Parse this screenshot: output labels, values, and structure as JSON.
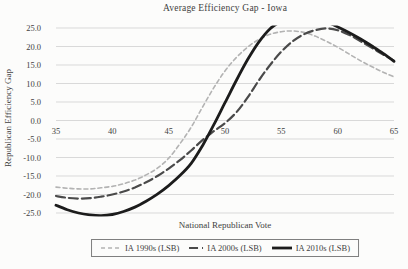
{
  "chart_data": {
    "type": "line",
    "title": "Average Efficiency Gap - Iowa",
    "xlabel": "National Republican Vote",
    "ylabel": "Republican Efficiency Gap",
    "xlim": [
      35,
      65
    ],
    "ylim": [
      -25,
      25
    ],
    "x_ticks": [
      "35",
      "40",
      "45",
      "50",
      "55",
      "60",
      "65"
    ],
    "y_ticks": [
      {
        "value": 25,
        "label": "25.0"
      },
      {
        "value": 20,
        "label": "20.0"
      },
      {
        "value": 15,
        "label": "15.0"
      },
      {
        "value": 10,
        "label": "10.0"
      },
      {
        "value": 5,
        "label": "5.0"
      },
      {
        "value": 0,
        "label": "0.0"
      },
      {
        "value": -5,
        "label": "-5.0"
      },
      {
        "value": -10,
        "label": "-10.0"
      },
      {
        "value": -15,
        "label": "-15.0"
      },
      {
        "value": -20,
        "label": "-20.0"
      },
      {
        "value": -25,
        "label": "-25.0"
      }
    ],
    "grid": "horizontal",
    "gridline_color": "#d9d9d9",
    "legend_position": "bottom",
    "x": [
      35,
      36,
      37,
      38,
      39,
      40,
      41,
      42,
      43,
      44,
      45,
      46,
      47,
      48,
      49,
      50,
      51,
      52,
      53,
      54,
      55,
      56,
      57,
      58,
      59,
      60,
      61,
      62,
      63,
      64,
      65
    ],
    "series": [
      {
        "name": "IA 1990s (LSB)",
        "color": "#b3b3b3",
        "dash": "4 3",
        "width": 1.6,
        "values": [
          -18.0,
          -18.3,
          -18.5,
          -18.5,
          -18.2,
          -17.8,
          -17.1,
          -16.1,
          -14.7,
          -12.9,
          -10.2,
          -6.3,
          -1.8,
          3.6,
          8.8,
          13.4,
          17.0,
          19.8,
          21.9,
          23.3,
          24.0,
          24.2,
          23.8,
          22.8,
          21.4,
          19.8,
          18.0,
          16.2,
          14.6,
          13.1,
          11.8
        ]
      },
      {
        "name": "IA 2000s (LSB)",
        "color": "#4a4a4a",
        "dash": "9 4",
        "width": 2.2,
        "values": [
          -20.4,
          -20.9,
          -21.1,
          -21.0,
          -20.6,
          -20.0,
          -19.2,
          -18.1,
          -16.7,
          -15.0,
          -13.0,
          -10.7,
          -8.1,
          -5.3,
          -2.9,
          -0.7,
          2.2,
          6.2,
          10.8,
          15.0,
          18.6,
          21.4,
          23.3,
          24.4,
          24.9,
          24.4,
          23.2,
          21.5,
          19.7,
          17.9,
          16.2
        ]
      },
      {
        "name": "IA 2010s (LSB)",
        "color": "#1c1c1c",
        "dash": null,
        "width": 2.8,
        "values": [
          -22.9,
          -24.1,
          -25.0,
          -25.5,
          -25.7,
          -25.4,
          -24.6,
          -23.4,
          -21.8,
          -19.9,
          -17.6,
          -14.9,
          -11.6,
          -6.8,
          -1.2,
          4.8,
          10.8,
          16.4,
          21.2,
          24.8,
          26.8,
          27.9,
          28.2,
          27.8,
          26.7,
          25.3,
          23.8,
          22.1,
          20.2,
          18.2,
          16.0
        ]
      }
    ]
  }
}
